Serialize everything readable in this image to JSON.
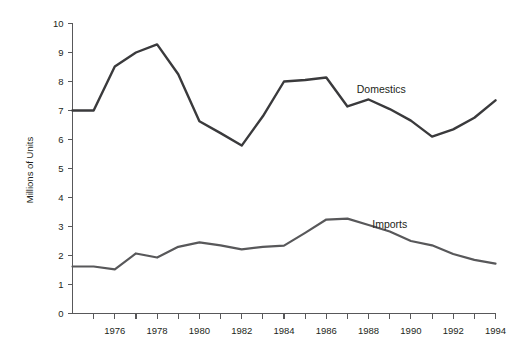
{
  "chart_data": {
    "type": "line",
    "title": "",
    "xlabel": "",
    "ylabel": "Millions of Units",
    "xlim": [
      1974,
      1994
    ],
    "ylim": [
      0,
      10
    ],
    "grid": false,
    "legend_position": "inline-annotation",
    "x": [
      1974,
      1975,
      1976,
      1977,
      1978,
      1979,
      1980,
      1981,
      1982,
      1983,
      1984,
      1985,
      1986,
      1987,
      1988,
      1989,
      1990,
      1991,
      1992,
      1993,
      1994
    ],
    "x_tick_labels": [
      "1976",
      "1978",
      "1980",
      "1982",
      "1984",
      "1986",
      "1988",
      "1990",
      "1992",
      "1994"
    ],
    "x_tick_values": [
      1976,
      1978,
      1980,
      1982,
      1984,
      1986,
      1988,
      1990,
      1992,
      1994
    ],
    "y_tick_labels": [
      "0",
      "1",
      "2",
      "3",
      "4",
      "5",
      "6",
      "7",
      "8",
      "9",
      "10"
    ],
    "y_tick_values": [
      0,
      1,
      2,
      3,
      4,
      5,
      6,
      7,
      8,
      9,
      10
    ],
    "series": [
      {
        "name": "Domestics",
        "color": "#3a3a3c",
        "stroke_width": 2.4,
        "label_x": 1988.6,
        "label_y": 7.62,
        "values": [
          7.0,
          7.0,
          8.52,
          9.0,
          9.28,
          8.25,
          6.63,
          6.22,
          5.79,
          6.8,
          8.0,
          8.05,
          8.14,
          7.14,
          7.38,
          7.05,
          6.65,
          6.1,
          6.35,
          6.75,
          7.35
        ]
      },
      {
        "name": "Imports",
        "color": "#58585a",
        "stroke_width": 2.2,
        "label_x": 1989.0,
        "label_y": 2.95,
        "values": [
          1.62,
          1.62,
          1.52,
          2.07,
          1.93,
          2.3,
          2.45,
          2.35,
          2.21,
          2.3,
          2.34,
          2.78,
          3.24,
          3.27,
          3.05,
          2.83,
          2.5,
          2.35,
          2.05,
          1.85,
          1.72
        ]
      }
    ],
    "annotations": [
      {
        "text": "Domestics",
        "x": 1988.6,
        "y": 7.62
      },
      {
        "text": "Imports",
        "x": 1989.0,
        "y": 2.95
      }
    ]
  },
  "axis": {
    "y_title": "Millions of Units"
  }
}
